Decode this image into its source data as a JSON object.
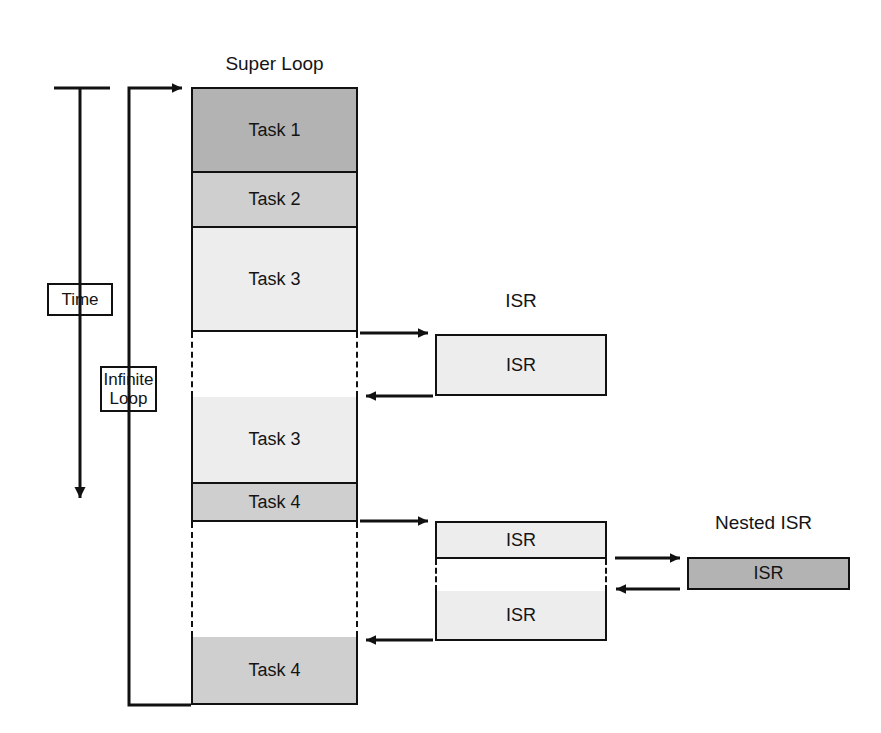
{
  "diagram": {
    "colors": {
      "dark_gray": "#b3b3b3",
      "mid_gray": "#cfcfcf",
      "light_gray": "#ededed",
      "white": "#ffffff",
      "line": "#111111"
    }
  },
  "time_axis": {
    "label": "Time",
    "arrow_direction": "down"
  },
  "loop": {
    "label": "Infinite\nLoop"
  },
  "super_loop": {
    "title": "Super Loop",
    "subtitle": "(Background)",
    "blocks": [
      {
        "label": "Task 1",
        "shade": "dark_gray"
      },
      {
        "label": "Task 2",
        "shade": "mid_gray"
      },
      {
        "label": "Task 3",
        "shade": "light_gray"
      },
      {
        "label": "",
        "shade": "gap"
      },
      {
        "label": "Task 3",
        "shade": "light_gray"
      },
      {
        "label": "Task 4",
        "shade": "mid_gray"
      },
      {
        "label": "",
        "shade": "gap"
      },
      {
        "label": "Task 4",
        "shade": "mid_gray"
      }
    ]
  },
  "isr_panel": {
    "title": "ISR",
    "subtitle": "(Foreground)",
    "blocks": [
      {
        "label": "ISR",
        "shade": "light_gray"
      }
    ]
  },
  "nested_group": {
    "blocks": [
      {
        "label": "ISR",
        "shade": "light_gray"
      },
      {
        "label": "",
        "shade": "gap"
      },
      {
        "label": "ISR",
        "shade": "light_gray"
      }
    ]
  },
  "nested_isr_panel": {
    "title": "Nested ISR",
    "subtitle": "(Foreground)",
    "blocks": [
      {
        "label": "ISR",
        "shade": "dark_gray"
      }
    ]
  }
}
